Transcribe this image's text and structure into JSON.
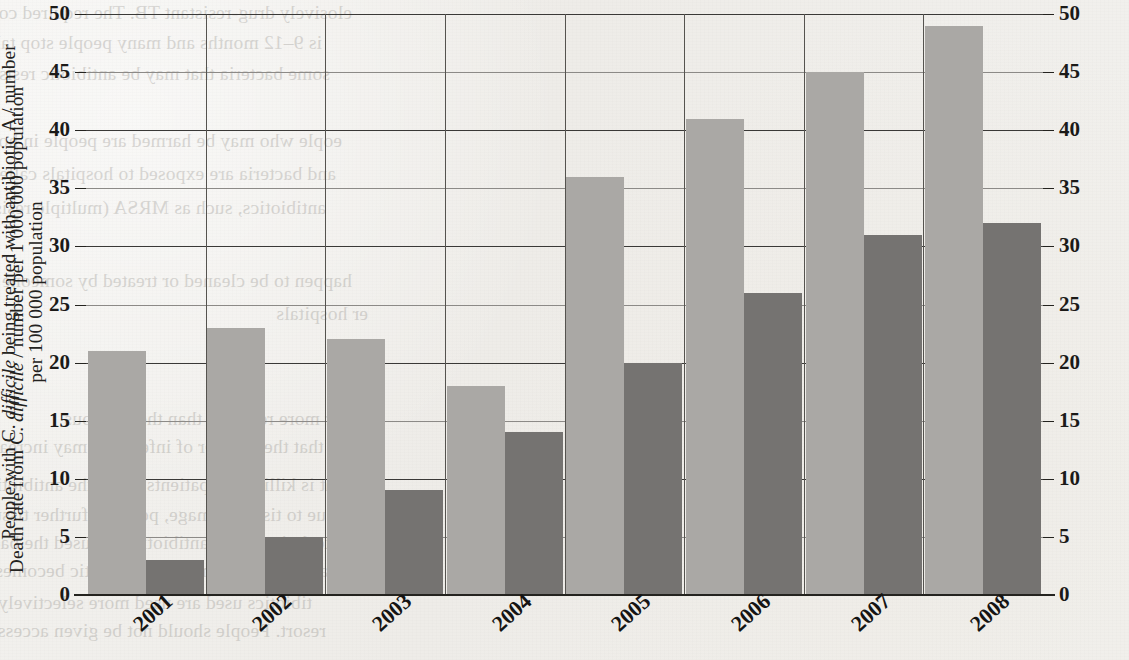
{
  "chart_data": {
    "type": "bar",
    "title": "",
    "subtitle": "",
    "xlabel": "",
    "categories": [
      "2001",
      "2002",
      "2003",
      "2004",
      "2005",
      "2006",
      "2007",
      "2008"
    ],
    "series": [
      {
        "name": "People with C. difficile being treated with antibiotic A / number per 100 000 population",
        "axis": "left",
        "color": "#aaa8a5",
        "values": [
          21,
          23,
          22,
          18,
          36,
          41,
          45,
          49
        ]
      },
      {
        "name": "Death rate from C. difficile / number per 1 000 000 population",
        "axis": "right",
        "color": "#757371",
        "values": [
          3,
          5,
          9,
          14,
          20,
          26,
          31,
          32
        ]
      }
    ],
    "ylabel_left_parts": {
      "pre": "People with C. ",
      "italic": "difficile",
      "post": " being treated with antibiotic A / number",
      "line2": "per 100 000 population"
    },
    "ylabel_right_parts": {
      "pre": "Death rate from C. ",
      "italic": "difficile",
      "post": " / number per 1 000 000 population"
    },
    "ylim": [
      0,
      50
    ],
    "ytick_step": 5,
    "yticks": [
      "0",
      "5",
      "10",
      "15",
      "20",
      "25",
      "30",
      "35",
      "40",
      "45",
      "50"
    ],
    "yticks_left": [
      "50",
      "45",
      "40",
      "35",
      "30",
      "25",
      "20",
      "15",
      "10",
      "5",
      "0"
    ],
    "yticks_right": [
      "50",
      "45",
      "40",
      "35",
      "30",
      "25",
      "20",
      "15",
      "10",
      "5",
      "0"
    ],
    "grid": true,
    "grid_vertical": true,
    "legend": "none"
  },
  "bleed_text": [
    {
      "text": "elosively drug-resistant TB. The required course of antimicrobials for the",
      "x": 352,
      "y": -6
    },
    {
      "text": "is 9–12 months and many people stop taking the antibiotics when they feel better. This",
      "x": 322,
      "y": 24
    },
    {
      "text": "some bacteria that may be antibiotic resistant and could be passed to other uninfected",
      "x": 330,
      "y": 55
    },
    {
      "text": "eople who may be harmed are people in hospitals where antibiotic",
      "x": 342,
      "y": 122
    },
    {
      "text": "and bacteria are exposed to hospitals called super bugs and plasmids",
      "x": 336,
      "y": 155
    },
    {
      "text": "antibiotics, such as MRSA (multiple resistant Staph aureus bacteria) that are found on the",
      "x": 326,
      "y": 189
    },
    {
      "text": "happen to be cleaned or treated by someone",
      "x": 352,
      "y": 262
    },
    {
      "text": "er hospitals",
      "x": 368,
      "y": 295
    },
    {
      "text": "ther more resistant than the previous",
      "x": 356,
      "y": 400
    },
    {
      "text": "is that the number of infections may increase",
      "x": 342,
      "y": 428
    },
    {
      "text": "at is killing the patients is not the antibiotic susceptibility",
      "x": 334,
      "y": 466
    },
    {
      "text": "ue to tissue damage, possible further tissue damage or septicaemia",
      "x": 326,
      "y": 496
    },
    {
      "text": "techniques. As antibiotics are used the bacteria multiply and mutate",
      "x": 330,
      "y": 524
    },
    {
      "text": "sage, medication or the antibiotic becomes less effective over time",
      "x": 336,
      "y": 552
    },
    {
      "text": "tibiotics used are used more selectively and in severe cases should they be used only as a",
      "x": 312,
      "y": 584
    },
    {
      "text": "resort. People should not be given access to antibiotics when they just feel unwell",
      "x": 326,
      "y": 612
    }
  ]
}
